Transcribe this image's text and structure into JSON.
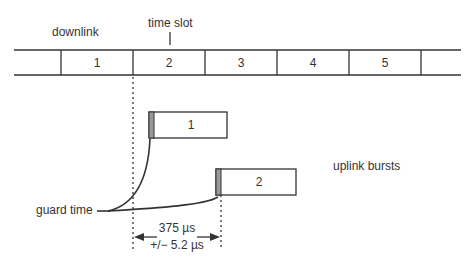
{
  "labels": {
    "downlink": "downlink",
    "time_slot": "time slot",
    "uplink_bursts": "uplink bursts",
    "guard_time": "guard time",
    "delay_value": "375 µs",
    "delay_tolerance": "+/− 5.2 µs"
  },
  "downlink_slots": [
    "1",
    "2",
    "3",
    "4",
    "5"
  ],
  "bursts": [
    {
      "label": "1"
    },
    {
      "label": "2"
    }
  ],
  "colors": {
    "line": "#333333",
    "guard_fill": "#999999"
  }
}
